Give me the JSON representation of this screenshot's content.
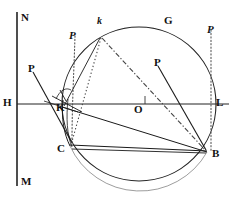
{
  "figure": {
    "kind": "geometric-optics-diagram",
    "width": 233,
    "height": 198,
    "background": "#ffffff",
    "ink": "#1a1a1a"
  },
  "labels": {
    "N": "N",
    "M": "M",
    "H": "H",
    "L": "L",
    "O": "O",
    "G": "G",
    "C": "C",
    "B": "B",
    "K": "K",
    "k_small": "k",
    "P_left_italic": "P",
    "P_right_italic": "P",
    "P_left_bold": "P",
    "P_mid_bold": "P"
  },
  "points": {
    "O": {
      "x": 139,
      "y": 104,
      "label": "O"
    },
    "H": {
      "x": 17,
      "y": 104,
      "label": "H"
    },
    "L": {
      "x": 213,
      "y": 104,
      "label": "L"
    },
    "N": {
      "x": 17,
      "y": 14,
      "label": "N"
    },
    "M": {
      "x": 17,
      "y": 184,
      "label": "M"
    },
    "G": {
      "x": 170,
      "y": 27,
      "label": "G"
    },
    "k": {
      "x": 100,
      "y": 34,
      "label": "k"
    },
    "K": {
      "x": 66,
      "y": 104,
      "label": "K"
    },
    "C": {
      "x": 70,
      "y": 145,
      "label": "C"
    },
    "B": {
      "x": 208,
      "y": 152,
      "label": "B"
    }
  },
  "circle": {
    "cx": 139,
    "cy": 104,
    "r": 77,
    "stroke": "#222222",
    "stroke_width": 1.1,
    "fill": "none"
  },
  "axes": {
    "horizontal": {
      "x1": 17,
      "y1": 104,
      "x2": 229,
      "y2": 104,
      "label_left": "H",
      "label_right": "L"
    },
    "vertical": {
      "x1": 17,
      "y1": 12,
      "x2": 17,
      "y2": 186,
      "label_top": "N",
      "label_bottom": "M"
    }
  },
  "dotted_verticals": [
    {
      "name": "left-dotted-vertical",
      "x_top": 75,
      "y_top": 36,
      "x_bot": 72,
      "y_bot": 140
    },
    {
      "name": "right-dotted-vertical",
      "x_top": 211,
      "y_top": 30,
      "x_bot": 211,
      "y_bot": 150
    }
  ],
  "rays": [
    {
      "name": "ray-P-left-to-C",
      "x1": 33,
      "y1": 72,
      "x2": 72,
      "y2": 143,
      "style": "solid"
    },
    {
      "name": "ray-P-mid-to-B",
      "x1": 158,
      "y1": 66,
      "x2": 206,
      "y2": 150,
      "style": "solid"
    },
    {
      "name": "chord-C-to-B",
      "x1": 70,
      "y1": 146,
      "x2": 207,
      "y2": 152,
      "style": "solid"
    },
    {
      "name": "chord-K-to-B",
      "x1": 62,
      "y1": 107,
      "x2": 207,
      "y2": 152,
      "style": "solid"
    },
    {
      "name": "chord-C-to-B-lower",
      "x1": 72,
      "y1": 149,
      "x2": 206,
      "y2": 153,
      "style": "solid"
    },
    {
      "name": "ray-k-to-C-dotted",
      "x1": 101,
      "y1": 38,
      "x2": 71,
      "y2": 145,
      "style": "dotted"
    },
    {
      "name": "ray-k-to-B-dashdot",
      "x1": 102,
      "y1": 38,
      "x2": 206,
      "y2": 151,
      "style": "dashdot"
    },
    {
      "name": "ray-k-to-K-solid",
      "x1": 100,
      "y1": 38,
      "x2": 64,
      "y2": 106,
      "style": "solid"
    },
    {
      "name": "tangent-at-K",
      "x1": 52,
      "y1": 96,
      "x2": 82,
      "y2": 112,
      "style": "solid"
    }
  ],
  "label_positions": {
    "N": {
      "x": 21,
      "y": 12,
      "style": "bold"
    },
    "M": {
      "x": 21,
      "y": 176,
      "style": "bold"
    },
    "H": {
      "x": 4,
      "y": 97,
      "style": "bold"
    },
    "L": {
      "x": 216,
      "y": 97,
      "style": "bold"
    },
    "O": {
      "x": 135,
      "y": 104,
      "style": "bold"
    },
    "G": {
      "x": 164,
      "y": 16,
      "style": "bold"
    },
    "C": {
      "x": 58,
      "y": 144,
      "style": "bold"
    },
    "B": {
      "x": 212,
      "y": 148,
      "style": "bold"
    },
    "K": {
      "x": 57,
      "y": 103,
      "style": "bold"
    },
    "k_small": {
      "x": 97,
      "y": 17,
      "style": "italic"
    },
    "P_left_italic": {
      "x": 70,
      "y": 31,
      "style": "italic"
    },
    "P_right_italic": {
      "x": 207,
      "y": 25,
      "style": "italic"
    },
    "P_left_bold": {
      "x": 28,
      "y": 64,
      "style": "bold"
    },
    "P_mid_bold": {
      "x": 154,
      "y": 58,
      "style": "bold"
    }
  }
}
